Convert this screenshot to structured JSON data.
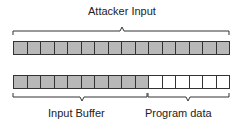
{
  "labels": {
    "attacker_input": "Attacker Input",
    "input_buffer": "Input Buffer",
    "program_data": "Program data"
  },
  "top_row": {
    "cells": 16,
    "filled": 16
  },
  "bottom_row": {
    "cells": 16,
    "filled": 10
  },
  "colors": {
    "filled": "#b8b8b8",
    "empty": "#ffffff",
    "stroke": "#333333"
  }
}
